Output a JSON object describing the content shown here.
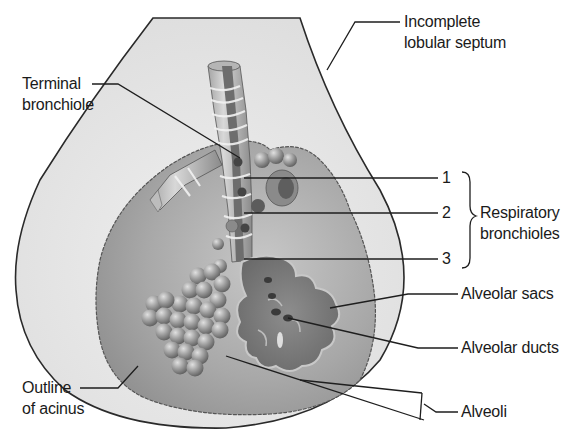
{
  "diagram": {
    "labels": {
      "incomplete_septum": [
        "Incomplete",
        "lobular septum"
      ],
      "terminal_bronchiole": [
        "Terminal",
        "bronchiole"
      ],
      "respiratory_bronchioles": [
        "Respiratory",
        "bronchioles"
      ],
      "respiratory_numbers": [
        "1",
        "2",
        "3"
      ],
      "alveolar_sacs": "Alveolar sacs",
      "alveolar_ducts": "Alveolar ducts",
      "alveoli": "Alveoli",
      "outline_acinus": [
        "Outline",
        "of acinus"
      ]
    },
    "colors": {
      "lobule_fill": "#e4e4e4",
      "acinus_fill": "#a9a9a9",
      "bronchiole_dark": "#6f6f6f",
      "bronchiole_light": "#c9c9c9",
      "line": "#222222",
      "sac_fill": "#7c7c7c",
      "alveoli_fill": "#9a9a9a"
    }
  }
}
